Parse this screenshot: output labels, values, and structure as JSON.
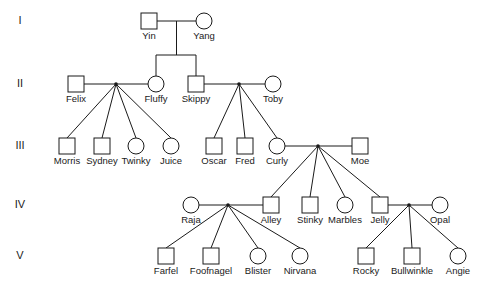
{
  "chart_data": {
    "type": "diagram",
    "diagram_kind": "pedigree",
    "generation_labels": [
      "I",
      "II",
      "III",
      "IV",
      "V"
    ],
    "symbol_legend": {
      "square": "male",
      "circle": "female"
    },
    "colors": {
      "line": "#1a1a1a",
      "symbol_fill": "#ffffff",
      "background": "#ffffff",
      "text": "#1a1a1a"
    },
    "individuals": [
      {
        "id": "yin",
        "name": "Yin",
        "sex": "male",
        "generation": "I",
        "x": 149,
        "y": 21
      },
      {
        "id": "yang",
        "name": "Yang",
        "sex": "female",
        "generation": "I",
        "x": 204,
        "y": 21
      },
      {
        "id": "felix",
        "name": "Felix",
        "sex": "male",
        "generation": "II",
        "x": 76,
        "y": 84
      },
      {
        "id": "fluffy",
        "name": "Fluffy",
        "sex": "female",
        "generation": "II",
        "x": 156,
        "y": 84
      },
      {
        "id": "skippy",
        "name": "Skippy",
        "sex": "male",
        "generation": "II",
        "x": 196,
        "y": 84
      },
      {
        "id": "toby",
        "name": "Toby",
        "sex": "female",
        "generation": "II",
        "x": 273,
        "y": 84
      },
      {
        "id": "morris",
        "name": "Morris",
        "sex": "male",
        "generation": "III",
        "x": 67,
        "y": 146
      },
      {
        "id": "sydney",
        "name": "Sydney",
        "sex": "male",
        "generation": "III",
        "x": 102,
        "y": 146
      },
      {
        "id": "twinky",
        "name": "Twinky",
        "sex": "female",
        "generation": "III",
        "x": 136,
        "y": 146
      },
      {
        "id": "juice",
        "name": "Juice",
        "sex": "female",
        "generation": "III",
        "x": 171,
        "y": 146
      },
      {
        "id": "oscar",
        "name": "Oscar",
        "sex": "male",
        "generation": "III",
        "x": 214,
        "y": 146
      },
      {
        "id": "fred",
        "name": "Fred",
        "sex": "male",
        "generation": "III",
        "x": 245,
        "y": 146
      },
      {
        "id": "curly",
        "name": "Curly",
        "sex": "female",
        "generation": "III",
        "x": 277,
        "y": 146
      },
      {
        "id": "moe",
        "name": "Moe",
        "sex": "male",
        "generation": "III",
        "x": 360,
        "y": 146
      },
      {
        "id": "raja",
        "name": "Raja",
        "sex": "female",
        "generation": "IV",
        "x": 191,
        "y": 205
      },
      {
        "id": "alley",
        "name": "Alley",
        "sex": "male",
        "generation": "IV",
        "x": 271,
        "y": 205
      },
      {
        "id": "stinky",
        "name": "Stinky",
        "sex": "male",
        "generation": "IV",
        "x": 310,
        "y": 205
      },
      {
        "id": "marbles",
        "name": "Marbles",
        "sex": "female",
        "generation": "IV",
        "x": 345,
        "y": 205
      },
      {
        "id": "jelly",
        "name": "Jelly",
        "sex": "male",
        "generation": "IV",
        "x": 380,
        "y": 205
      },
      {
        "id": "opal",
        "name": "Opal",
        "sex": "female",
        "generation": "IV",
        "x": 440,
        "y": 205
      },
      {
        "id": "farfel",
        "name": "Farfel",
        "sex": "male",
        "generation": "V",
        "x": 166,
        "y": 256
      },
      {
        "id": "foofnagel",
        "name": "Foofnagel",
        "sex": "male",
        "generation": "V",
        "x": 211,
        "y": 256
      },
      {
        "id": "blister",
        "name": "Blister",
        "sex": "female",
        "generation": "V",
        "x": 258,
        "y": 256
      },
      {
        "id": "nirvana",
        "name": "Nirvana",
        "sex": "female",
        "generation": "V",
        "x": 300,
        "y": 256
      },
      {
        "id": "rocky",
        "name": "Rocky",
        "sex": "male",
        "generation": "V",
        "x": 366,
        "y": 256
      },
      {
        "id": "bullwinkle",
        "name": "Bullwinkle",
        "sex": "male",
        "generation": "V",
        "x": 412,
        "y": 256
      },
      {
        "id": "angie",
        "name": "Angie",
        "sex": "female",
        "generation": "V",
        "x": 458,
        "y": 256
      }
    ],
    "unions": [
      {
        "id": "u1",
        "partners": [
          "yin",
          "yang"
        ],
        "children": [
          "fluffy",
          "skippy"
        ]
      },
      {
        "id": "u2",
        "partners": [
          "felix",
          "fluffy"
        ],
        "children": [
          "morris",
          "sydney",
          "twinky",
          "juice"
        ]
      },
      {
        "id": "u3",
        "partners": [
          "skippy",
          "toby"
        ],
        "children": [
          "oscar",
          "fred",
          "curly"
        ]
      },
      {
        "id": "u4",
        "partners": [
          "curly",
          "moe"
        ],
        "children": [
          "alley",
          "stinky",
          "marbles",
          "jelly"
        ]
      },
      {
        "id": "u5",
        "partners": [
          "raja",
          "alley"
        ],
        "children": [
          "farfel",
          "foofnagel",
          "blister",
          "nirvana"
        ]
      },
      {
        "id": "u6",
        "partners": [
          "jelly",
          "opal"
        ],
        "children": [
          "rocky",
          "bullwinkle",
          "angie"
        ]
      }
    ],
    "generation_rows": [
      {
        "label": "I",
        "y": 21
      },
      {
        "label": "II",
        "y": 84
      },
      {
        "label": "III",
        "y": 146
      },
      {
        "label": "IV",
        "y": 205
      },
      {
        "label": "V",
        "y": 256
      }
    ]
  }
}
